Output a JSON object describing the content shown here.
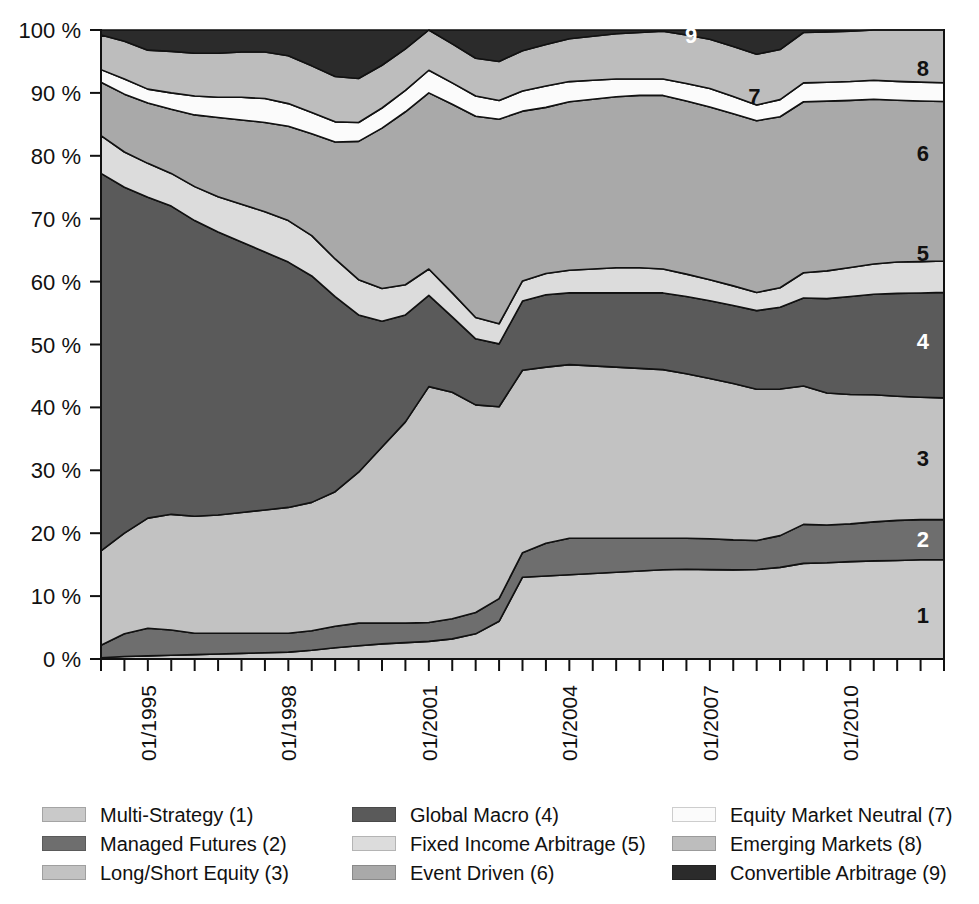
{
  "chart_data": {
    "type": "area",
    "stacked": true,
    "normalized_percent": true,
    "title": "",
    "xlabel": "",
    "ylabel": "",
    "ylim": [
      0,
      100
    ],
    "ytick_labels": [
      "0 %",
      "10 %",
      "20 %",
      "30 %",
      "40 %",
      "50 %",
      "60 %",
      "70 %",
      "80 %",
      "90 %",
      "100 %"
    ],
    "ytick_values": [
      0,
      10,
      20,
      30,
      40,
      50,
      60,
      70,
      80,
      90,
      100
    ],
    "xtick_labels": [
      "01/1995",
      "01/1998",
      "01/2001",
      "01/2004",
      "01/2007",
      "01/2010"
    ],
    "xtick_values": [
      "1995-01",
      "1998-01",
      "2001-01",
      "2004-01",
      "2007-01",
      "2010-01"
    ],
    "x_minor_tick_interval_months": 6,
    "x_range": [
      "1994-01",
      "2011-12"
    ],
    "grid": false,
    "legend_position": "bottom",
    "x": [
      "1994-01",
      "1994-07",
      "1995-01",
      "1995-07",
      "1996-01",
      "1996-07",
      "1997-01",
      "1997-07",
      "1998-01",
      "1998-07",
      "1999-01",
      "1999-07",
      "2000-01",
      "2000-07",
      "2001-01",
      "2001-07",
      "2002-01",
      "2002-07",
      "2003-01",
      "2003-07",
      "2004-01",
      "2004-07",
      "2005-01",
      "2005-07",
      "2006-01",
      "2006-07",
      "2007-01",
      "2007-07",
      "2008-01",
      "2008-07",
      "2009-01",
      "2009-07",
      "2010-01",
      "2010-07",
      "2011-01",
      "2011-07",
      "2011-12"
    ],
    "series": [
      {
        "name": "Multi-Strategy",
        "index": 1,
        "color": "#c9c9c9",
        "values": [
          0.2,
          0.4,
          0.5,
          0.6,
          0.7,
          0.8,
          0.9,
          1.0,
          1.1,
          1.4,
          1.8,
          2.1,
          2.4,
          2.6,
          2.8,
          3.2,
          4.0,
          6.0,
          13.0,
          13.2,
          13.4,
          13.6,
          13.8,
          14.0,
          14.2,
          14.4,
          14.5,
          14.6,
          14.8,
          15.0,
          15.2,
          15.3,
          15.5,
          15.6,
          15.7,
          15.8,
          15.8
        ]
      },
      {
        "name": "Managed Futures",
        "index": 2,
        "color": "#6e6e6e",
        "values": [
          2.0,
          3.6,
          4.4,
          4.0,
          3.4,
          3.3,
          3.2,
          3.1,
          3.0,
          3.1,
          3.4,
          3.6,
          3.3,
          3.1,
          3.0,
          3.2,
          3.4,
          3.6,
          3.9,
          5.2,
          5.8,
          5.6,
          5.4,
          5.2,
          5.0,
          5.0,
          5.0,
          4.9,
          4.8,
          5.2,
          6.2,
          6.0,
          6.0,
          6.2,
          6.4,
          6.4,
          6.4
        ]
      },
      {
        "name": "Long/Short Equity",
        "index": 3,
        "color": "#c2c2c2",
        "values": [
          15.0,
          16.0,
          17.5,
          18.4,
          18.6,
          18.8,
          19.2,
          19.6,
          20.0,
          20.4,
          21.4,
          24.0,
          28.0,
          32.0,
          37.5,
          36.0,
          33.0,
          30.5,
          29.0,
          28.0,
          27.6,
          27.4,
          27.2,
          27.0,
          26.8,
          26.4,
          26.0,
          25.6,
          25.0,
          24.0,
          22.0,
          21.0,
          20.6,
          20.2,
          19.8,
          19.5,
          19.4
        ]
      },
      {
        "name": "Global Macro",
        "index": 4,
        "color": "#5a5a5a",
        "values": [
          60.0,
          55.0,
          51.0,
          49.0,
          47.0,
          45.0,
          43.0,
          41.0,
          39.0,
          36.0,
          31.0,
          25.0,
          20.0,
          17.0,
          14.5,
          12.0,
          10.5,
          10.0,
          11.0,
          11.5,
          11.4,
          11.6,
          11.8,
          12.0,
          12.2,
          12.4,
          12.6,
          12.8,
          13.0,
          13.4,
          14.0,
          15.0,
          15.6,
          16.0,
          16.4,
          16.6,
          16.8
        ]
      },
      {
        "name": "Fixed Income Arbitrage",
        "index": 5,
        "color": "#dcdcdc",
        "values": [
          6.0,
          5.6,
          5.4,
          5.2,
          5.4,
          5.6,
          6.0,
          6.4,
          6.6,
          6.4,
          6.0,
          5.6,
          5.2,
          4.8,
          4.2,
          3.8,
          3.4,
          3.2,
          3.2,
          3.4,
          3.6,
          3.8,
          4.0,
          4.0,
          3.8,
          3.6,
          3.4,
          3.2,
          3.0,
          3.2,
          4.0,
          4.4,
          4.6,
          4.8,
          5.0,
          5.0,
          5.0
        ]
      },
      {
        "name": "Event Driven",
        "index": 6,
        "color": "#a9a9a9",
        "values": [
          8.5,
          9.2,
          9.6,
          10.2,
          11.4,
          12.6,
          13.4,
          14.2,
          15.0,
          16.2,
          18.6,
          22.0,
          25.5,
          27.5,
          28.0,
          30.0,
          32.0,
          32.5,
          27.0,
          26.4,
          26.8,
          27.0,
          27.2,
          27.4,
          27.6,
          27.8,
          28.0,
          28.2,
          28.4,
          28.0,
          27.2,
          27.0,
          26.6,
          26.2,
          25.8,
          25.6,
          25.4
        ]
      },
      {
        "name": "Equity Market Neutral",
        "index": 7,
        "color": "#fbfbfb",
        "values": [
          2.0,
          2.4,
          2.2,
          2.6,
          3.0,
          3.2,
          3.6,
          3.8,
          3.6,
          3.4,
          3.2,
          3.0,
          3.2,
          3.4,
          3.6,
          3.4,
          3.2,
          3.0,
          3.2,
          3.4,
          3.2,
          3.0,
          2.8,
          2.6,
          2.6,
          2.8,
          3.0,
          2.8,
          2.6,
          2.8,
          3.0,
          3.0,
          3.0,
          3.0,
          3.0,
          3.0,
          3.0
        ]
      },
      {
        "name": "Emerging Markets",
        "index": 8,
        "color": "#bdbdbd",
        "values": [
          5.5,
          6.0,
          6.2,
          6.6,
          6.8,
          7.0,
          7.2,
          7.4,
          7.6,
          7.4,
          7.2,
          7.0,
          6.8,
          6.6,
          6.4,
          6.2,
          6.0,
          6.2,
          6.4,
          6.6,
          6.8,
          7.0,
          7.2,
          7.4,
          7.6,
          7.8,
          8.0,
          8.2,
          8.4,
          8.2,
          8.0,
          8.0,
          8.0,
          8.0,
          8.2,
          8.3,
          8.4
        ]
      },
      {
        "name": "Convertible Arbitrage",
        "index": 9,
        "color": "#2b2b2b",
        "values": [
          0.8,
          1.8,
          3.2,
          3.4,
          3.7,
          3.7,
          3.5,
          3.5,
          4.1,
          5.7,
          7.4,
          7.7,
          5.6,
          3.0,
          0.0,
          2.2,
          4.5,
          5.0,
          3.3,
          2.3,
          1.4,
          1.0,
          0.6,
          0.4,
          0.2,
          0.8,
          1.5,
          2.7,
          4.0,
          3.2,
          0.4,
          0.3,
          0.2,
          0.0,
          0.0,
          0.0,
          0.0
        ]
      }
    ]
  },
  "legend": {
    "columns": [
      {
        "items": [
          {
            "label": "Multi-Strategy (1)",
            "color": "#c9c9c9"
          },
          {
            "label": "Managed Futures (2)",
            "color": "#6e6e6e"
          },
          {
            "label": "Long/Short Equity (3)",
            "color": "#c2c2c2"
          }
        ]
      },
      {
        "items": [
          {
            "label": "Global Macro (4)",
            "color": "#5a5a5a"
          },
          {
            "label": "Fixed Income Arbitrage (5)",
            "color": "#dcdcdc"
          },
          {
            "label": "Event Driven (6)",
            "color": "#a9a9a9"
          }
        ]
      },
      {
        "items": [
          {
            "label": "Equity Market Neutral (7)",
            "color": "#fbfbfb"
          },
          {
            "label": "Emerging Markets (8)",
            "color": "#bdbdbd"
          },
          {
            "label": "Convertible Arbitrage (9)",
            "color": "#2b2b2b"
          }
        ]
      }
    ]
  },
  "band_labels": [
    {
      "text": "1",
      "x_frac": 0.975,
      "y_pct": 7.0,
      "color": "#111111"
    },
    {
      "text": "2",
      "x_frac": 0.975,
      "y_pct": 19.0,
      "color": "#ffffff"
    },
    {
      "text": "3",
      "x_frac": 0.975,
      "y_pct": 32.0,
      "color": "#111111"
    },
    {
      "text": "4",
      "x_frac": 0.975,
      "y_pct": 50.5,
      "color": "#ffffff"
    },
    {
      "text": "5",
      "x_frac": 0.975,
      "y_pct": 64.5,
      "color": "#111111"
    },
    {
      "text": "6",
      "x_frac": 0.975,
      "y_pct": 80.5,
      "color": "#111111"
    },
    {
      "text": "7",
      "x_frac": 0.775,
      "y_pct": 89.5,
      "color": "#111111"
    },
    {
      "text": "8",
      "x_frac": 0.975,
      "y_pct": 94.0,
      "color": "#111111"
    },
    {
      "text": "9",
      "x_frac": 0.7,
      "y_pct": 99.2,
      "color": "#ffffff"
    }
  ],
  "axis": {
    "line_color": "#111111",
    "tick_color": "#111111"
  }
}
